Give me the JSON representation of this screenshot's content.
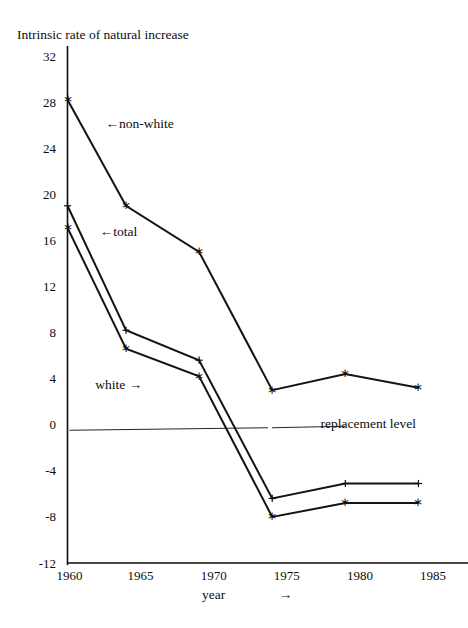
{
  "scan_artifact": "",
  "chart_data": {
    "type": "line",
    "title": "Intrinsic rate of natural increase",
    "ylabel": "Intrinsic rate of natural increase",
    "xlabel": "year",
    "xlabel_arrow": "→",
    "ylim": [
      -12,
      32
    ],
    "xlim": [
      1960,
      1986.5
    ],
    "grid": false,
    "legend": "inline-annotations",
    "yticks": [
      32,
      28,
      24,
      20,
      16,
      12,
      8,
      4,
      0,
      -4,
      -8,
      -12
    ],
    "ytick_labels": [
      "32",
      "28",
      "24",
      "20",
      "16",
      "12",
      "8",
      "4",
      "0",
      "-4",
      "-8",
      "-12"
    ],
    "xticks": [
      1960,
      1965,
      1970,
      1975,
      1980,
      1985
    ],
    "xtick_labels": [
      "1960",
      "1965",
      "1970",
      "1975",
      "1980",
      "1985"
    ],
    "series": [
      {
        "name": "non-white",
        "marker": "asterisk",
        "label": "←non-white",
        "x": [
          1960,
          1964,
          1969,
          1974,
          1979,
          1984
        ],
        "values": [
          28.2,
          19.0,
          15.0,
          3.0,
          4.4,
          3.2
        ]
      },
      {
        "name": "total",
        "marker": "plus",
        "label": "←total",
        "x": [
          1960,
          1964,
          1969,
          1974,
          1979,
          1984
        ],
        "values": [
          19.0,
          8.2,
          5.6,
          -6.4,
          -5.1,
          -5.1
        ]
      },
      {
        "name": "white",
        "marker": "asterisk",
        "label": "white →",
        "x": [
          1960,
          1964,
          1969,
          1974,
          1979,
          1984
        ],
        "values": [
          17.1,
          6.6,
          4.2,
          -8.0,
          -6.8,
          -6.8
        ]
      }
    ],
    "annotations": [
      {
        "name": "non-white-label",
        "text": "←non-white",
        "x": 1962.6,
        "y": 26.0
      },
      {
        "name": "total-label",
        "text": "←total",
        "x": 1962.2,
        "y": 16.6
      },
      {
        "name": "white-label",
        "text": "white →",
        "x": 1961.9,
        "y": 3.4
      },
      {
        "name": "replacement-level-label",
        "text": "replacement level",
        "x": 1977.3,
        "y": 0.0
      }
    ],
    "reference_line": {
      "name": "replacement level",
      "label": "replacement level",
      "value": -0.35,
      "style": "thin-solid"
    },
    "colors": {
      "ink": "#0d0d0d",
      "line": "#141414",
      "background": "#ffffff"
    }
  }
}
